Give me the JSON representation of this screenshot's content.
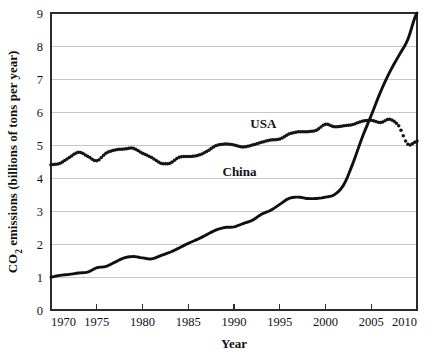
{
  "chart_data": {
    "type": "line",
    "title": "",
    "xlabel": "Year",
    "ylabel": "CO2 emissions (billions of tons per year)",
    "ylabel_parts": {
      "prefix": "CO",
      "subscript": "2",
      "suffix": " emissions (billions of tons per year)"
    },
    "xlim": [
      1970,
      2010
    ],
    "ylim": [
      0,
      9
    ],
    "grid": true,
    "legend_position": "inline-annotations",
    "x_tick_labels": [
      "1970",
      "1975",
      "1980",
      "1985",
      "1990",
      "1995",
      "2000",
      "2005",
      "2010"
    ],
    "x_ticks": [
      1970,
      1975,
      1980,
      1985,
      1990,
      1995,
      2000,
      2005,
      2010
    ],
    "y_tick_labels": [
      "0",
      "1",
      "2",
      "3",
      "4",
      "5",
      "6",
      "7",
      "8",
      "9"
    ],
    "y_ticks": [
      0,
      1,
      2,
      3,
      4,
      5,
      6,
      7,
      8,
      9
    ],
    "x": [
      1970,
      1971,
      1972,
      1973,
      1974,
      1975,
      1976,
      1977,
      1978,
      1979,
      1980,
      1981,
      1982,
      1983,
      1984,
      1985,
      1986,
      1987,
      1988,
      1989,
      1990,
      1991,
      1992,
      1993,
      1994,
      1995,
      1996,
      1997,
      1998,
      1999,
      2000,
      2001,
      2002,
      2003,
      2004,
      2005,
      2006,
      2007,
      2008,
      2009,
      2010
    ],
    "series": [
      {
        "name": "USA",
        "style": "dotted",
        "color": "#151515",
        "label_x": 1993.2,
        "label_y": 5.52,
        "values": [
          4.4,
          4.45,
          4.62,
          4.78,
          4.66,
          4.52,
          4.75,
          4.85,
          4.88,
          4.9,
          4.75,
          4.62,
          4.45,
          4.45,
          4.63,
          4.65,
          4.68,
          4.8,
          4.98,
          5.03,
          5.0,
          4.94,
          5.0,
          5.08,
          5.15,
          5.18,
          5.33,
          5.4,
          5.4,
          5.45,
          5.63,
          5.55,
          5.58,
          5.62,
          5.72,
          5.75,
          5.68,
          5.78,
          5.58,
          5.02,
          5.12
        ]
      },
      {
        "name": "China",
        "style": "solid",
        "color": "#101010",
        "label_x": 1990.6,
        "label_y": 4.05,
        "values": [
          1.0,
          1.05,
          1.08,
          1.12,
          1.15,
          1.28,
          1.32,
          1.45,
          1.58,
          1.62,
          1.58,
          1.55,
          1.65,
          1.75,
          1.88,
          2.02,
          2.14,
          2.28,
          2.42,
          2.5,
          2.52,
          2.62,
          2.72,
          2.9,
          3.02,
          3.2,
          3.38,
          3.42,
          3.38,
          3.38,
          3.42,
          3.5,
          3.8,
          4.45,
          5.22,
          5.9,
          6.6,
          7.2,
          7.7,
          8.2,
          9.0
        ]
      }
    ]
  }
}
